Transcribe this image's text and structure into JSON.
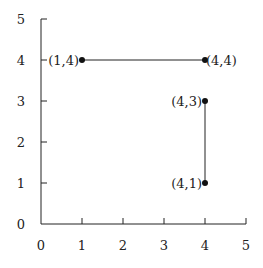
{
  "chart_data": {
    "type": "scatter",
    "title": "",
    "xlabel": "",
    "ylabel": "",
    "xlim": [
      0,
      5
    ],
    "ylim": [
      0,
      5
    ],
    "grid": false,
    "x_ticks": [
      0,
      1,
      2,
      3,
      4,
      5
    ],
    "y_ticks": [
      0,
      1,
      2,
      3,
      4,
      5
    ],
    "x_tick_labels": [
      "0",
      "1",
      "2",
      "3",
      "4",
      "5"
    ],
    "y_tick_labels": [
      "0",
      "1",
      "2",
      "3",
      "4",
      "5"
    ],
    "points": [
      {
        "x": 1,
        "y": 4,
        "label": "(1,4)",
        "label_side": "left"
      },
      {
        "x": 4,
        "y": 4,
        "label": "(4,4)",
        "label_side": "right"
      },
      {
        "x": 4,
        "y": 3,
        "label": "(4,3)",
        "label_side": "left"
      },
      {
        "x": 4,
        "y": 1,
        "label": "(4,1)",
        "label_side": "left"
      }
    ],
    "segments": [
      {
        "from": [
          1,
          4
        ],
        "to": [
          4,
          4
        ]
      },
      {
        "from": [
          4,
          3
        ],
        "to": [
          4,
          1
        ]
      }
    ]
  },
  "style": {
    "line_color": "#222222",
    "point_color": "#111111"
  }
}
